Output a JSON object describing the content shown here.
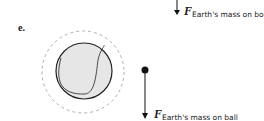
{
  "part_label": "e.",
  "top_force": {
    "symbol": "F",
    "subscript": "Earth's mass on book"
  },
  "bottom_force": {
    "symbol": "F",
    "subscript": "Earth's mass on ball"
  },
  "objects": {
    "ball": "tennis-ball",
    "point": "ball-point-mass"
  }
}
